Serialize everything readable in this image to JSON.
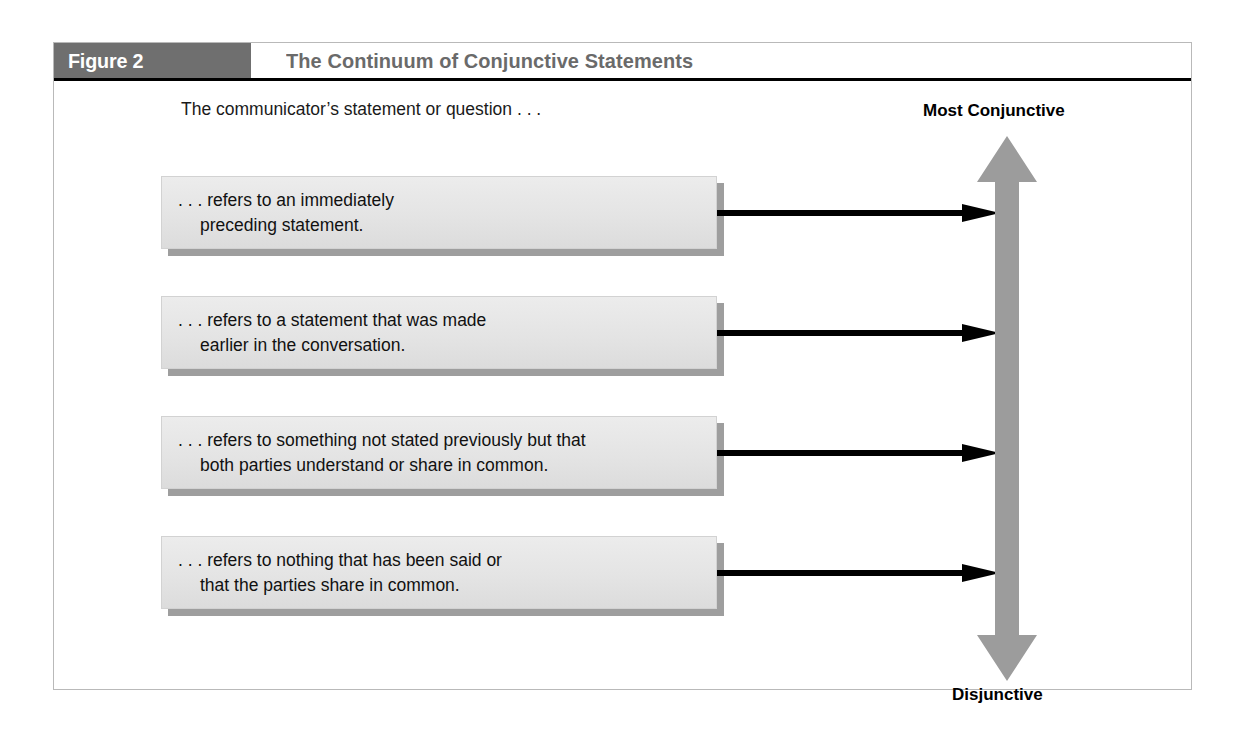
{
  "figure": {
    "tag": "Figure 2",
    "title": "The Continuum of Conjunctive Statements",
    "caption": "The communicator’s statement or question . . .",
    "colors": {
      "tag_band": "#6f6f6f",
      "title_text": "#6a6a6a",
      "box_fill": "#e4e4e4",
      "box_shadow": "#9e9e9e",
      "continuum_arrow": "#9c9c9c",
      "connector_arrow": "#000000",
      "frame_border": "#b9b9b9"
    },
    "statements": [
      {
        "line1": ". . . refers to an immediately",
        "line2": "preceding statement."
      },
      {
        "line1": ". . . refers to a statement that was made",
        "line2": "earlier in the conversation."
      },
      {
        "line1": ". . . refers to something not stated previously but that",
        "line2": "both parties understand or share in common."
      },
      {
        "line1": ". . . refers to nothing that has been said or",
        "line2": "that the parties share in common."
      }
    ],
    "continuum": {
      "top_label": "Most Conjunctive",
      "bottom_label": "Disjunctive",
      "icon": "double-headed-vertical-arrow-icon"
    },
    "connector_icon": "right-arrow-icon"
  }
}
